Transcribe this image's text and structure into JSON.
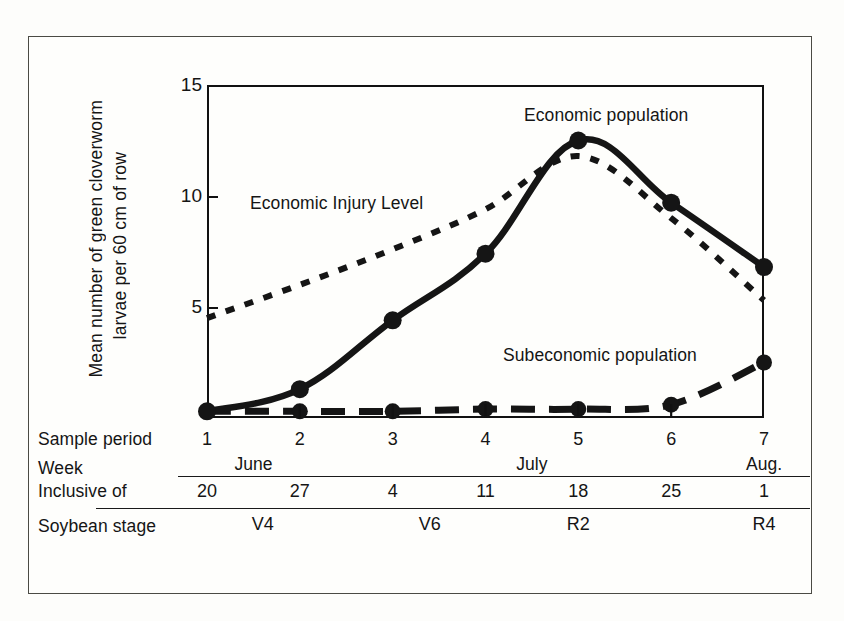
{
  "chart_data": {
    "type": "line",
    "title": "",
    "xlabel": "Sample period",
    "ylabel": "Mean number of green cloverworm larvae per 60 cm of row",
    "ylim": [
      0,
      15
    ],
    "yticks": [
      5,
      10,
      15
    ],
    "xticks": [
      1,
      2,
      3,
      4,
      5,
      6,
      7
    ],
    "grid": false,
    "legend_position": "in-plot annotations",
    "x": [
      1,
      2,
      3,
      4,
      5,
      6,
      7
    ],
    "series": [
      {
        "name": "Economic population",
        "style": "solid-with-markers",
        "values": [
          0.3,
          1.3,
          4.4,
          7.4,
          12.5,
          9.7,
          6.8
        ]
      },
      {
        "name": "Economic Injury Level",
        "style": "fine-dotted",
        "values": [
          4.5,
          6.0,
          7.6,
          9.4,
          11.8,
          9.0,
          5.3
        ]
      },
      {
        "name": "Subeconomic population",
        "style": "coarse-dashed-with-markers",
        "values": [
          0.3,
          0.3,
          0.3,
          0.4,
          0.4,
          0.6,
          2.5
        ]
      }
    ],
    "annotations": [
      {
        "text": "Economic population",
        "x": 5.2,
        "y": 13.6
      },
      {
        "text": "Economic Injury Level",
        "x": 2.1,
        "y": 10.2
      },
      {
        "text": "Subeconomic population",
        "x": 4.8,
        "y": 3.6
      }
    ]
  },
  "y_axis": {
    "title_line1": "Mean number of green cloverworm",
    "title_line2": "larvae per 60 cm of row",
    "ticks": [
      {
        "label": "15",
        "value": 15
      },
      {
        "label": "10",
        "value": 10
      },
      {
        "label": "5",
        "value": 5
      }
    ]
  },
  "table": {
    "row_labels": {
      "sample_period": "Sample period",
      "week": "Week",
      "inclusive_of": "Inclusive of",
      "soybean_stage": "Soybean stage"
    },
    "sample_periods": [
      "1",
      "2",
      "3",
      "4",
      "5",
      "6",
      "7"
    ],
    "weeks": [
      "20",
      "27",
      "4",
      "11",
      "18",
      "25",
      "1"
    ],
    "months": [
      {
        "label": "June",
        "start_period": 1,
        "end_period": 2
      },
      {
        "label": "July",
        "start_period": 3,
        "end_period": 6
      },
      {
        "label": "Aug.",
        "start_period": 7,
        "end_period": 7
      }
    ],
    "soybean_stages": [
      {
        "label": "V4",
        "period": 1.6
      },
      {
        "label": "V6",
        "period": 3.4
      },
      {
        "label": "R2",
        "period": 5.0
      },
      {
        "label": "R4",
        "period": 7.0
      }
    ]
  },
  "colors": {
    "ink": "#151515",
    "axis": "#111111",
    "border": "#4a4a44",
    "paper": "#fefefc"
  }
}
